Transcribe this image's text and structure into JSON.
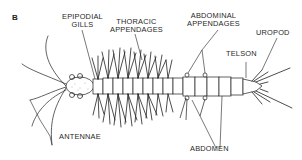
{
  "figure": {
    "panel_letter": "B",
    "labels": {
      "epipodial_gills_line1": "EPIPODIAL",
      "epipodial_gills_line2": "GILLS",
      "thoracic_line1": "THORACIC",
      "thoracic_line2": "APPENDAGES",
      "abdominal_line1": "ABDOMINAL",
      "abdominal_line2": "APPENDAGES",
      "uropod": "UROPOD",
      "telson": "TELSON",
      "antennae": "ANTENNAE",
      "abdomen": "ABDOMEN"
    },
    "colors": {
      "ink": "#1f1f1f",
      "background": "#ffffff"
    }
  }
}
